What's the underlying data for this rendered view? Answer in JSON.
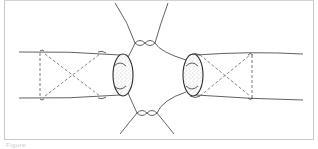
{
  "figure": {
    "caption": "Figure",
    "colors": {
      "line": "#3a3a3a",
      "dash": "#555555",
      "frame": "#c8c8c8",
      "stipple": "#9a9a9a"
    }
  }
}
